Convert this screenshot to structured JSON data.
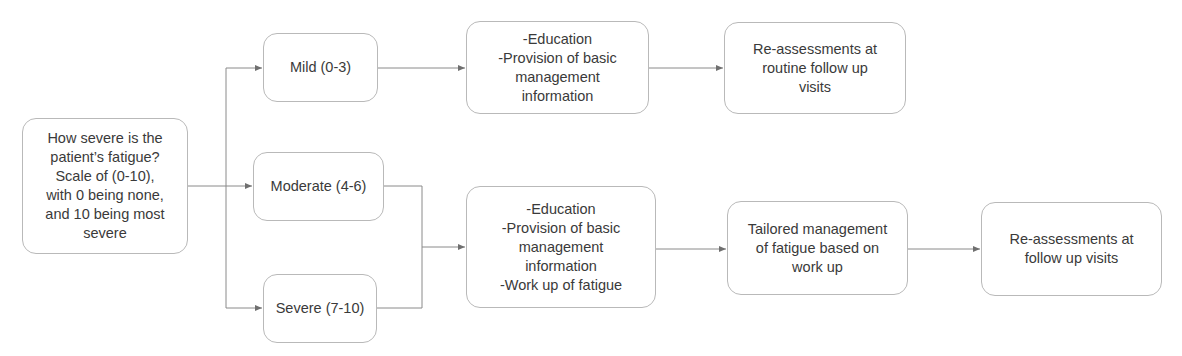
{
  "diagram": {
    "type": "flowchart",
    "colors": {
      "node_border": "#b9b9b9",
      "node_text": "#3a3a3a",
      "connector": "#8a8a8a",
      "background": "#ffffff"
    },
    "nodes": {
      "root": {
        "label": "How severe is the\npatient’s fatigue?\nScale of (0-10),\nwith 0 being none,\nand 10 being most\nsevere"
      },
      "mild": {
        "label": "Mild (0-3)"
      },
      "moderate": {
        "label": "Moderate (4-6)"
      },
      "severe": {
        "label": "Severe (7-10)"
      },
      "mild_management": {
        "label": "-Education\n-Provision of basic\nmanagement\ninformation"
      },
      "mild_followup": {
        "label": "Re-assessments at\nroutine follow up\nvisits"
      },
      "modsev_management": {
        "label": "-Education\n-Provision of basic\nmanagement\ninformation\n-Work up of fatigue"
      },
      "tailored_management": {
        "label": "Tailored management\nof fatigue based on\nwork up"
      },
      "modsev_followup": {
        "label": "Re-assessments at\nfollow up visits"
      }
    },
    "edges": [
      {
        "from": "root",
        "to": "mild"
      },
      {
        "from": "root",
        "to": "moderate"
      },
      {
        "from": "root",
        "to": "severe"
      },
      {
        "from": "mild",
        "to": "mild_management"
      },
      {
        "from": "mild_management",
        "to": "mild_followup"
      },
      {
        "from": "moderate",
        "to": "modsev_management"
      },
      {
        "from": "severe",
        "to": "modsev_management"
      },
      {
        "from": "modsev_management",
        "to": "tailored_management"
      },
      {
        "from": "tailored_management",
        "to": "modsev_followup"
      }
    ]
  }
}
